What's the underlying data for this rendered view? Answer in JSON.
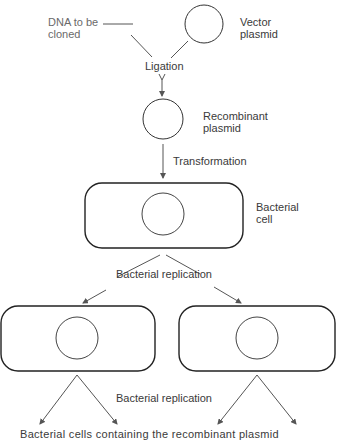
{
  "diagram": {
    "labels": {
      "dna_to_be_cloned_line1": "DNA to be",
      "dna_to_be_cloned_line2": "cloned",
      "vector_plasmid_line1": "Vector",
      "vector_plasmid_line2": "plasmid",
      "ligation": "Ligation",
      "recombinant_plasmid_line1": "Recombinant",
      "recombinant_plasmid_line2": "plasmid",
      "transformation": "Transformation",
      "bacterial_cell_line1": "Bacterial",
      "bacterial_cell_line2": "cell",
      "bacterial_replication_1": "Bacterial replication",
      "bacterial_replication_2": "Bacterial replication",
      "footer_clipped": "Bacterial cells containing the recombinant plasmid"
    },
    "nodes": [
      {
        "id": "dna",
        "label": "DNA to be cloned",
        "shape": "line"
      },
      {
        "id": "vector",
        "label": "Vector plasmid",
        "shape": "circle"
      },
      {
        "id": "recombinant",
        "label": "Recombinant plasmid",
        "shape": "circle"
      },
      {
        "id": "cell",
        "label": "Bacterial cell",
        "shape": "rounded-rect-with-circle"
      },
      {
        "id": "cell_left",
        "label": "",
        "shape": "rounded-rect-with-circle"
      },
      {
        "id": "cell_right",
        "label": "",
        "shape": "rounded-rect-with-circle"
      }
    ],
    "edges": [
      {
        "from": "dna",
        "to": "recombinant",
        "label": "Ligation"
      },
      {
        "from": "vector",
        "to": "recombinant",
        "label": "Ligation"
      },
      {
        "from": "recombinant",
        "to": "cell",
        "label": "Transformation"
      },
      {
        "from": "cell",
        "to": "cell_left",
        "label": "Bacterial replication"
      },
      {
        "from": "cell",
        "to": "cell_right",
        "label": "Bacterial replication"
      },
      {
        "from": "cell_left",
        "to": "offscreen",
        "label": "Bacterial replication"
      },
      {
        "from": "cell_right",
        "to": "offscreen",
        "label": "Bacterial replication"
      }
    ],
    "colors": {
      "stroke": "#2a2a2a",
      "arrow": "#555555",
      "text": "#3a3a3a",
      "background": "#ffffff"
    }
  }
}
